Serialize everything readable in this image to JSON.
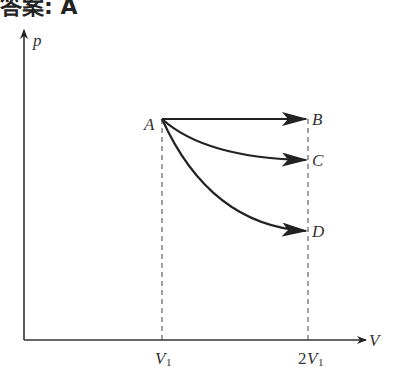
{
  "header": {
    "text": "答案: A"
  },
  "diagram": {
    "type": "p-V diagram",
    "axes": {
      "y_label": "p",
      "x_label": "V"
    },
    "ticks": [
      {
        "main": "V",
        "sub": "1",
        "prefix": ""
      },
      {
        "main": "V",
        "sub": "1",
        "prefix": "2"
      }
    ],
    "points": [
      {
        "name": "A",
        "V": "V1"
      },
      {
        "name": "B",
        "V": "2V1"
      },
      {
        "name": "C",
        "V": "2V1"
      },
      {
        "name": "D",
        "V": "2V1"
      }
    ],
    "processes": [
      "A→B",
      "A→C",
      "A→D"
    ],
    "colors": {
      "line": "#222222",
      "dashed": "#444444"
    }
  }
}
